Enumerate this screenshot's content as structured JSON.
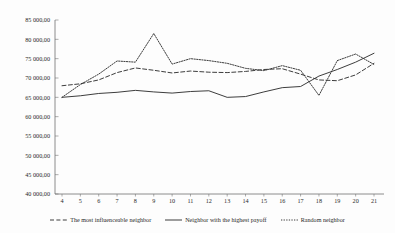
{
  "chart_data": {
    "type": "line",
    "title": "",
    "subtitle": "",
    "xlabel": "",
    "ylabel": "",
    "grid": false,
    "legend_position": "bottom",
    "xlim": [
      4,
      21
    ],
    "ylim": [
      40000,
      85000
    ],
    "x": [
      4,
      5,
      6,
      7,
      8,
      9,
      10,
      11,
      12,
      13,
      14,
      15,
      16,
      17,
      18,
      19,
      20,
      21
    ],
    "y_ticks": [
      40000,
      45000,
      50000,
      55000,
      60000,
      65000,
      70000,
      75000,
      80000,
      85000
    ],
    "y_tick_labels": [
      "40 000,00",
      "45 000,00",
      "50 000,00",
      "55 000,00",
      "60 000,00",
      "65 000,00",
      "70 000,00",
      "75 000,00",
      "80 000,00",
      "85 000,00"
    ],
    "x_tick_labels": [
      "4",
      "5",
      "6",
      "7",
      "8",
      "9",
      "10",
      "11",
      "12",
      "13",
      "14",
      "15",
      "16",
      "17",
      "18",
      "19",
      "20",
      "21"
    ],
    "series": [
      {
        "name": "The most influenceable neighbor",
        "style": "dashed",
        "color": "#333333",
        "values": [
          68000,
          68500,
          69500,
          71400,
          72600,
          72000,
          71300,
          71800,
          71500,
          71400,
          71700,
          72200,
          72400,
          71000,
          69500,
          69300,
          70800,
          73800
        ]
      },
      {
        "name": "Neighbor with the highest payoff",
        "style": "solid",
        "color": "#333333",
        "values": [
          65000,
          65400,
          66000,
          66300,
          66800,
          66400,
          66100,
          66500,
          66700,
          65000,
          65200,
          66400,
          67500,
          67800,
          70500,
          72200,
          74100,
          76400
        ]
      },
      {
        "name": "Random neighbor",
        "style": "dotted",
        "color": "#333333",
        "values": [
          65000,
          68300,
          71000,
          74400,
          74100,
          81500,
          73600,
          75000,
          74500,
          73800,
          72500,
          71900,
          73200,
          72000,
          65500,
          74500,
          76200,
          73500
        ]
      }
    ]
  },
  "legend": {
    "items": [
      {
        "label": "The most influenceable neighbor",
        "marker": "dashed-line-swatch"
      },
      {
        "label": "Neighbor with the highest payoff",
        "marker": "solid-line-swatch"
      },
      {
        "label": "Random neighbor",
        "marker": "dotted-line-swatch"
      }
    ]
  }
}
